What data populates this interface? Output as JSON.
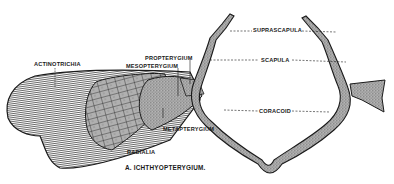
{
  "figure": {
    "caption": "A. ICHTHYOPTERYGIUM.",
    "labels": {
      "actinotrichia": "ACTINOTRICHIA",
      "propterygium": "PROPTERYGIUM",
      "mesopterygium": "MESOPTERYGIUM",
      "metapterygium": "METAPTERYGIUM",
      "radialia": "RADIALIA",
      "suprascapula": "SUPRASCAPULA",
      "scapula": "SCAPULA",
      "coracoid": "CORACOID"
    },
    "colors": {
      "ink": "#1a1a1a",
      "bone_fill": "#9a9a9a",
      "background": "#ffffff"
    }
  }
}
